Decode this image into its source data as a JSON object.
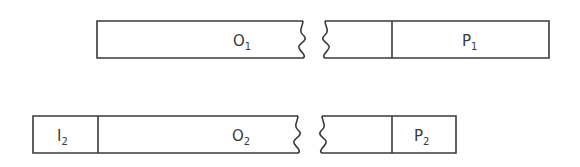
{
  "diagram": {
    "bars": [
      {
        "id": "bar-1",
        "segments": [
          {
            "name": "O",
            "subscript": "1"
          },
          {
            "name": "P",
            "subscript": "1"
          }
        ]
      },
      {
        "id": "bar-2",
        "segments": [
          {
            "name": "I",
            "subscript": "2"
          },
          {
            "name": "O",
            "subscript": "2"
          },
          {
            "name": "P",
            "subscript": "2"
          }
        ]
      }
    ],
    "colors": {
      "line": "#3a3a3a",
      "background": "#ffffff"
    }
  }
}
